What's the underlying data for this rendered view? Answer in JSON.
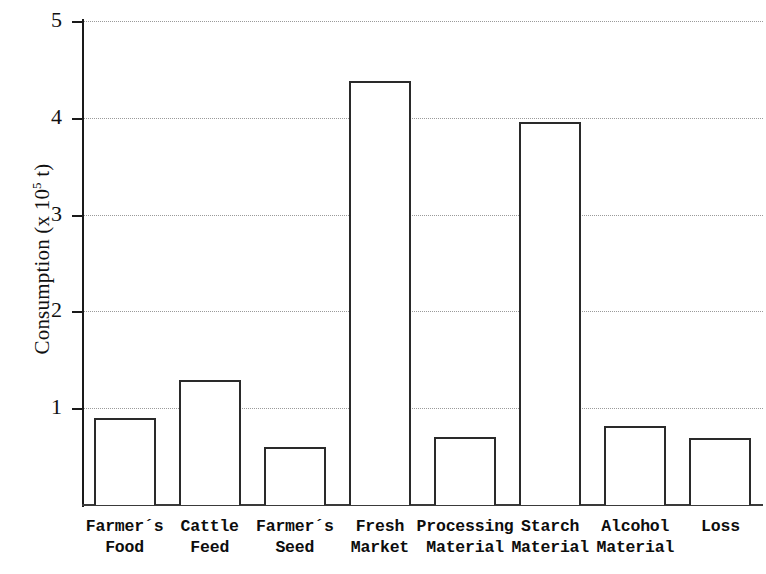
{
  "chart_data": {
    "type": "bar",
    "title": "",
    "xlabel": "",
    "ylabel": "Consumption  (x 10^5 t)",
    "ylabel_prefix": "Consumption  (x 10",
    "ylabel_exponent": "5",
    "ylabel_suffix": " t)",
    "ylim": [
      0,
      5
    ],
    "yticks": [
      1,
      2,
      3,
      4,
      5
    ],
    "ytick_labels": [
      "1",
      "2",
      "3",
      "4",
      "5"
    ],
    "grid": true,
    "grid_axis": "y",
    "grid_style": "dotted",
    "legend": false,
    "bar_fill": "#ffffff",
    "bar_edge": "#2a2a2a",
    "categories": [
      "Farmer´s Food",
      "Cattle Feed",
      "Farmer´s Seed",
      "Fresh Market",
      "Processing Material",
      "Starch Material",
      "Alcohol Material",
      "Loss"
    ],
    "category_lines": [
      [
        "Farmer´s",
        "Food"
      ],
      [
        "Cattle",
        "Feed"
      ],
      [
        "Farmer´s",
        "Seed"
      ],
      [
        "Fresh",
        "Market"
      ],
      [
        "Processing",
        "Material"
      ],
      [
        "Starch",
        "Material"
      ],
      [
        "Alcohol",
        "Material"
      ],
      [
        "Loss",
        ""
      ]
    ],
    "values": [
      0.9,
      1.29,
      0.6,
      4.38,
      0.7,
      3.96,
      0.82,
      0.69
    ]
  }
}
